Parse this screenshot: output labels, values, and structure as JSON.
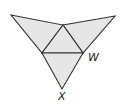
{
  "diagram": {
    "type": "net of triangular pyramid",
    "fill_color": "#e6e6e6",
    "stroke_color": "#333333",
    "vertices": {
      "left_apex": [
        11,
        15
      ],
      "top_center": [
        63,
        25
      ],
      "right_apex": [
        115,
        16
      ],
      "left_mid": [
        42,
        53
      ],
      "right_mid_w": [
        83,
        53
      ],
      "bottom_x": [
        62,
        89
      ]
    },
    "faces": [
      {
        "name": "left-face",
        "points": "11,15 63,25 42,53"
      },
      {
        "name": "right-face",
        "points": "63,25 115,16 83,53"
      },
      {
        "name": "center-face",
        "points": "63,25 42,53 83,53"
      },
      {
        "name": "bottom-face",
        "points": "42,53 83,53 62,89"
      }
    ],
    "labels": {
      "w": "W",
      "x": "X"
    }
  }
}
